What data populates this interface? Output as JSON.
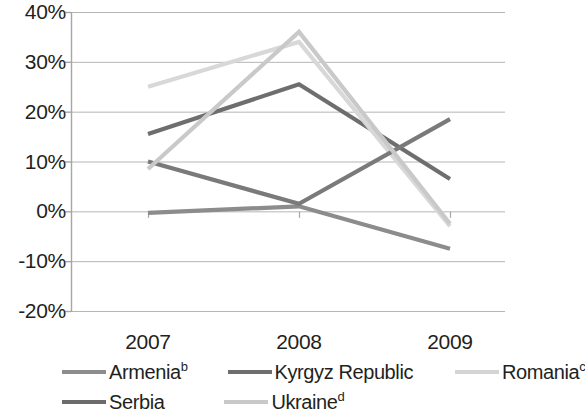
{
  "chart_data": {
    "type": "line",
    "title": "",
    "subtitle": "",
    "xlabel": "",
    "ylabel": "",
    "categories": [
      "2007",
      "2008",
      "2009"
    ],
    "x_tick_labels": [
      "2007",
      "2008",
      "2009"
    ],
    "y_tick_labels": [
      "40%",
      "30%",
      "20%",
      "10%",
      "0%",
      "-10%",
      "-20%"
    ],
    "y_tick_values": [
      40,
      30,
      20,
      10,
      0,
      -10,
      -20
    ],
    "ylim": [
      -20,
      40
    ],
    "y_unit": "%",
    "grid": "horizontal",
    "legend_position": "bottom",
    "series": [
      {
        "name": "Armenia",
        "footnote": "b",
        "label": "Armenia",
        "color": "#8c8c8c",
        "values": [
          -0.3,
          1.0,
          -7.5
        ]
      },
      {
        "name": "Kyrgyz Republic",
        "footnote": "",
        "label": "Kyrgyz Republic",
        "color": "#6e6e6e",
        "values": [
          15.5,
          25.5,
          6.5
        ]
      },
      {
        "name": "Romania",
        "footnote": "c",
        "label": "Romania",
        "color": "#d8d8d8",
        "values": [
          25.0,
          34.0,
          -3.0
        ]
      },
      {
        "name": "Serbia",
        "footnote": "",
        "label": "Serbia",
        "color": "#7a7a7a",
        "values": [
          10.0,
          1.5,
          18.5
        ]
      },
      {
        "name": "Ukraine",
        "footnote": "d",
        "label": "Ukraine",
        "color": "#c9c9c9",
        "values": [
          8.5,
          36.0,
          -2.5
        ]
      }
    ]
  },
  "axis": {
    "y_ticks": [
      {
        "label": "40%",
        "value": 40
      },
      {
        "label": "30%",
        "value": 30
      },
      {
        "label": "20%",
        "value": 20
      },
      {
        "label": "10%",
        "value": 10
      },
      {
        "label": "0%",
        "value": 0
      },
      {
        "label": "-10%",
        "value": -10
      },
      {
        "label": "-20%",
        "value": -20
      }
    ],
    "x_ticks": [
      {
        "label": "2007"
      },
      {
        "label": "2008"
      },
      {
        "label": "2009"
      }
    ]
  },
  "legend": {
    "rows": [
      [
        {
          "label": "Armenia",
          "footnote": "b",
          "color": "#8c8c8c"
        },
        {
          "label": "Kyrgyz Republic",
          "footnote": "",
          "color": "#6e6e6e"
        },
        {
          "label": "Romania",
          "footnote": "c",
          "color": "#d4d4d4"
        }
      ],
      [
        {
          "label": "Serbia",
          "footnote": "",
          "color": "#6b6b6b"
        },
        {
          "label": "Ukraine",
          "footnote": "d",
          "color": "#c9c9c9"
        }
      ]
    ]
  },
  "style": {
    "axis_color": "#a6a6a6",
    "grid_color": "#b5b5b5",
    "text_color": "#231f20",
    "background": "#ffffff"
  }
}
